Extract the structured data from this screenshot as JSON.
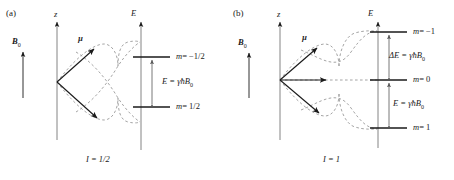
{
  "figure": {
    "colors": {
      "ink": "#1a1a1a",
      "dashed": "#9a9a9a",
      "background": "#ffffff"
    }
  },
  "panels": [
    {
      "tag": "(a)",
      "axis_z_label": "z",
      "axis_E_label": "E",
      "field_label": "B",
      "field_sub": "0",
      "moment_label": "µ",
      "caption_var": "I",
      "caption_value": "= 1/2",
      "caption_full": "I = 1/2",
      "spin_quantum_number": 0.5,
      "num_vectors": 2,
      "levels": [
        {
          "m_label": "m",
          "m_value": "= −1/2",
          "full": "m = −1/2",
          "y": 57
        },
        {
          "m_label": "m",
          "m_value": "= 1/2",
          "full": "m = 1/2",
          "y": 107
        }
      ],
      "gap_label": "E = γħB",
      "gap_sub": "0",
      "gap_full": "E = γħB0",
      "num_gaps": 1
    },
    {
      "tag": "(b)",
      "axis_z_label": "z",
      "axis_E_label": "E",
      "field_label": "B",
      "field_sub": "0",
      "moment_label": "µ",
      "caption_var": "I",
      "caption_value": "= 1",
      "caption_full": "I = 1",
      "spin_quantum_number": 1,
      "num_vectors": 3,
      "levels": [
        {
          "m_label": "m",
          "m_value": "= −1",
          "full": "m = −1",
          "y": 32
        },
        {
          "m_label": "m",
          "m_value": "= 0",
          "full": "m = 0",
          "y": 80
        },
        {
          "m_label": "m",
          "m_value": "= 1",
          "full": "m = 1",
          "y": 128
        }
      ],
      "gaps": [
        {
          "label": "ΔE = γħB",
          "sub": "0",
          "full": "ΔE = γħB0",
          "y": 56
        },
        {
          "label": "E = γħB",
          "sub": "0",
          "full": "E = γħB0",
          "y": 104
        }
      ],
      "num_gaps": 2
    }
  ]
}
